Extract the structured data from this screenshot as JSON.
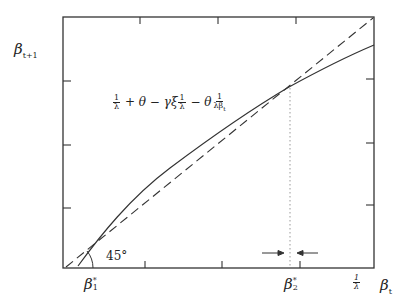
{
  "diagram": {
    "type": "phase-diagram",
    "y_axis_label": {
      "base": "β",
      "sub": "t+1"
    },
    "x_axis_label": {
      "base": "β",
      "sub": "t"
    },
    "x_markers": [
      {
        "base": "β",
        "sup": "*",
        "sub": "1"
      },
      {
        "base": "β",
        "sup": "*",
        "sub": "2"
      },
      {
        "num": "1",
        "den": "λ"
      }
    ],
    "curve_label": {
      "parts": [
        "1/λ",
        "+",
        "θ",
        "−",
        "γξ",
        "1/λ",
        "−",
        "θ",
        "1/(λβt)"
      ],
      "t1_num": "1",
      "t1_den": "λ",
      "plus": " + ",
      "theta1": "θ",
      "minus1": " − ",
      "gammaxi": "γξ",
      "t2_num": "1",
      "t2_den": "λ",
      "minus2": " − ",
      "theta2": "θ",
      "t3_num": "1",
      "t3_den": "λβ",
      "t3_den_sub": "t"
    },
    "angle_label": "45°",
    "arrows": [
      "→",
      "←"
    ],
    "colors": {
      "ink": "#222222",
      "dotted": "#aaaaaa",
      "background": "#ffffff"
    }
  }
}
